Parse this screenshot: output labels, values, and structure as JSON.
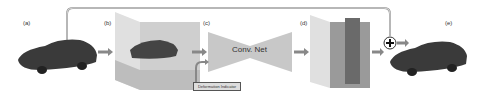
{
  "diagram": {
    "panels": [
      {
        "id": "a",
        "label": "(a)",
        "content": "input car mesh"
      },
      {
        "id": "b",
        "label": "(b)",
        "content": "voxelized grid with car"
      },
      {
        "id": "c",
        "label": "(c)",
        "content": "Conv. Net"
      },
      {
        "id": "d",
        "label": "(d)",
        "content": "output deformation grid"
      },
      {
        "id": "e",
        "label": "(e)",
        "content": "deformed car mesh"
      }
    ],
    "conv_net_label": "Conv. Net",
    "side_input_label": "Deformation Indicator",
    "combine_symbol": "+",
    "colors": {
      "grid": "#bbbbbb",
      "network": "#c8c8c8",
      "car": "#333333",
      "line": "#888888"
    }
  }
}
